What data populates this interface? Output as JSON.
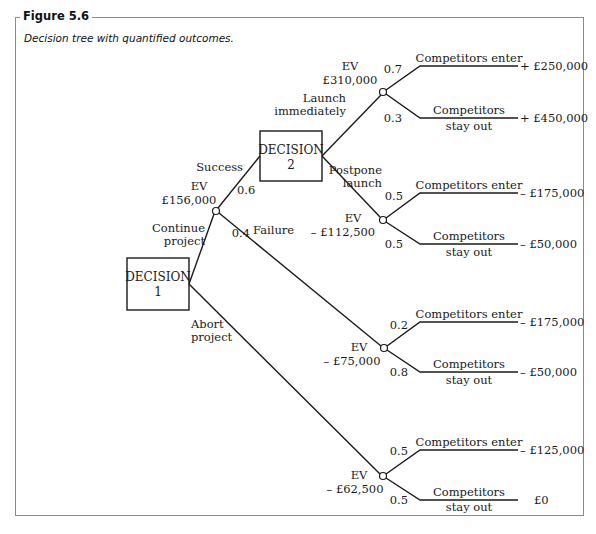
{
  "figure": {
    "title": "Figure 5.6",
    "caption": "Decision tree with quantified outcomes."
  },
  "decisions": [
    {
      "id": "decision-1",
      "label_line1": "DECISION",
      "label_line2": "1"
    },
    {
      "id": "decision-2",
      "label_line1": "DECISION",
      "label_line2": "2"
    }
  ],
  "branches": {
    "continue_line1": "Continue",
    "continue_line2": "project",
    "abort_line1": "Abort",
    "abort_line2": "project",
    "success": "Success",
    "failure": "Failure",
    "success_prob": "0.6",
    "failure_prob": "0.4",
    "launch_line1": "Launch",
    "launch_line2": "immediately",
    "postpone_line1": "Postpone",
    "postpone_line2": "launch"
  },
  "chance_nodes": [
    {
      "ev_label": "EV",
      "ev_value": "£310,000",
      "outcomes": [
        {
          "label_line1": "Competitors enter",
          "label_line2": "",
          "prob": "0.7",
          "value": "+ £250,000"
        },
        {
          "label_line1": "Competitors",
          "label_line2": "stay out",
          "prob": "0.3",
          "value": "+ £450,000"
        }
      ]
    },
    {
      "ev_label": "EV",
      "ev_value": "– £112,500",
      "outcomes": [
        {
          "label_line1": "Competitors enter",
          "label_line2": "",
          "prob": "0.5",
          "value": "– £175,000"
        },
        {
          "label_line1": "Competitors",
          "label_line2": "stay out",
          "prob": "0.5",
          "value": "– £50,000"
        }
      ]
    },
    {
      "ev_label": "EV",
      "ev_value": "– £75,000",
      "outcomes": [
        {
          "label_line1": "Competitors enter",
          "label_line2": "",
          "prob": "0.2",
          "value": "– £175,000"
        },
        {
          "label_line1": "Competitors",
          "label_line2": "stay out",
          "prob": "0.8",
          "value": "– £50,000"
        }
      ]
    },
    {
      "ev_label": "EV",
      "ev_value": "– £62,500",
      "outcomes": [
        {
          "label_line1": "Competitors enter",
          "label_line2": "",
          "prob": "0.5",
          "value": "– £125,000"
        },
        {
          "label_line1": "Competitors",
          "label_line2": "stay out",
          "prob": "0.5",
          "value": "£0"
        }
      ]
    }
  ],
  "continue_node": {
    "ev_label": "EV",
    "ev_value": "£156,000"
  },
  "colors": {
    "line": "#1a1a1a",
    "frame": "#8a8a8a"
  }
}
